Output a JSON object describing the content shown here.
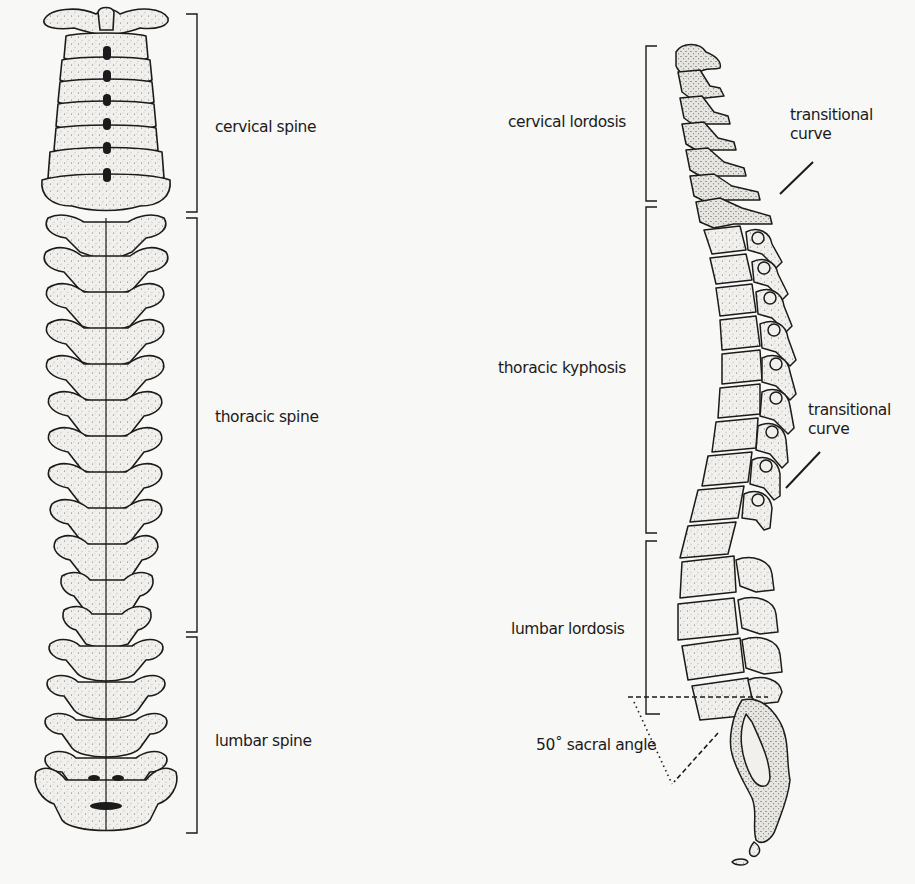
{
  "diagram": {
    "type": "anatomical-illustration",
    "colors": {
      "background": "#f8f8f6",
      "ink": "#1b1b1b",
      "bone_fill": "#f1f0ec",
      "stipple": "#555555"
    },
    "posterior_view": {
      "regions": [
        {
          "label": "cervical spine",
          "bracket_top": 14,
          "bracket_bottom": 212,
          "vertebrae": 7
        },
        {
          "label": "thoracic spine",
          "bracket_top": 218,
          "bracket_bottom": 632,
          "vertebrae": 12
        },
        {
          "label": "lumbar spine",
          "bracket_top": 637,
          "bracket_bottom": 833,
          "vertebrae": 5
        }
      ]
    },
    "lateral_view": {
      "curves": [
        {
          "label": "cervical lordosis",
          "bracket_top": 46,
          "bracket_bottom": 201
        },
        {
          "label": "thoracic kyphosis",
          "bracket_top": 207,
          "bracket_bottom": 533
        },
        {
          "label": "lumbar lordosis",
          "bracket_top": 541,
          "bracket_bottom": 714
        }
      ],
      "annotations": [
        {
          "label": "transitional\ncurve",
          "position": "cervicothoracic"
        },
        {
          "label": "transitional\ncurve",
          "position": "thoracolumbar"
        }
      ],
      "sacral_angle": {
        "label": "50˚ sacral angle",
        "degrees": 50
      }
    }
  }
}
